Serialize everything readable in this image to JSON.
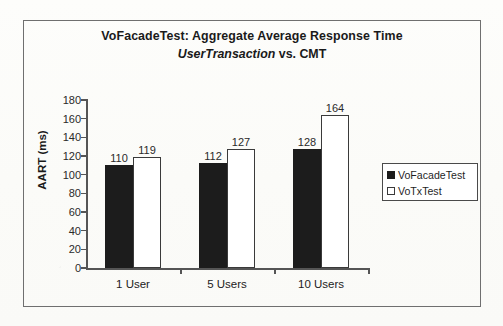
{
  "figure": {
    "background_color": "#fdfdfb",
    "frame_color": "#6f6f6f"
  },
  "chart_data": {
    "type": "bar",
    "title": "VoFacadeTest: Aggregate Average Response Time",
    "subtitle_italic": "UserTransaction",
    "subtitle_rest": " vs. CMT",
    "xlabel": "",
    "ylabel": "AART (ms)",
    "categories": [
      "1 User",
      "5 Users",
      "10 Users"
    ],
    "series": [
      {
        "name": "VoFacadeTest",
        "values": [
          110,
          112,
          128
        ],
        "color": "#1c1c1c",
        "style": "filled"
      },
      {
        "name": "VoTxTest",
        "values": [
          119,
          127,
          164
        ],
        "color": "#ffffff",
        "style": "hollow"
      }
    ],
    "ylim": [
      0,
      180
    ],
    "ytick_step": 20,
    "yticks": [
      0,
      20,
      40,
      60,
      80,
      100,
      120,
      140,
      160,
      180
    ],
    "ytick_labels": [
      "0",
      "20",
      "40",
      "60",
      "80",
      "100",
      "120",
      "140",
      "160",
      "180"
    ],
    "grid": false,
    "data_labels": true,
    "legend_position": "right"
  },
  "legend": {
    "items": [
      {
        "label": "VoFacadeTest",
        "marker": "filled-square-icon"
      },
      {
        "label": "VoTxTest",
        "marker": "hollow-square-icon"
      }
    ]
  }
}
